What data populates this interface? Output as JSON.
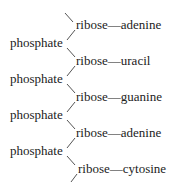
{
  "diagram": {
    "strand": [
      {
        "sugar": "ribose",
        "base": "adenine"
      },
      {
        "sugar": "ribose",
        "base": "uracil"
      },
      {
        "sugar": "ribose",
        "base": "guanine"
      },
      {
        "sugar": "ribose",
        "base": "adenine"
      },
      {
        "sugar": "ribose",
        "base": "cytosine"
      }
    ],
    "linkers": [
      "phosphate",
      "phosphate",
      "phosphate",
      "phosphate"
    ],
    "bond_symbol": "—",
    "colors": {
      "text": "#222222",
      "line": "#555555",
      "background": "#ffffff"
    }
  }
}
